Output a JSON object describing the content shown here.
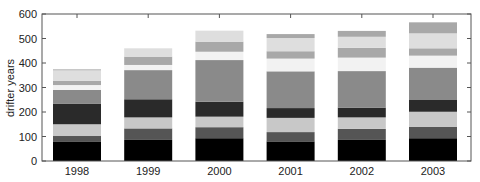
{
  "chart_data": {
    "type": "bar",
    "stacked": true,
    "title": "",
    "xlabel": "",
    "ylabel": "drifter years",
    "ylim": [
      0,
      600
    ],
    "yticks": [
      0,
      100,
      200,
      300,
      400,
      500,
      600
    ],
    "categories": [
      "1998",
      "1999",
      "2000",
      "2001",
      "2002",
      "2003"
    ],
    "grid": false,
    "legend": null,
    "series": [
      {
        "name": "segment-1",
        "color": "#000000",
        "values": [
          80,
          86,
          93,
          80,
          86,
          93
        ]
      },
      {
        "name": "segment-2",
        "color": "#555555",
        "values": [
          22,
          47,
          45,
          38,
          45,
          47
        ]
      },
      {
        "name": "segment-3",
        "color": "#c8c8c8",
        "values": [
          48,
          45,
          43,
          58,
          47,
          61
        ]
      },
      {
        "name": "segment-4",
        "color": "#2a2a2a",
        "values": [
          83,
          74,
          61,
          40,
          40,
          48
        ]
      },
      {
        "name": "segment-5",
        "color": "#8a8a8a",
        "values": [
          57,
          119,
          170,
          150,
          149,
          132
        ]
      },
      {
        "name": "segment-6",
        "color": "#f2f2f2",
        "values": [
          20,
          21,
          34,
          52,
          55,
          49
        ]
      },
      {
        "name": "segment-7",
        "color": "#a8a8a8",
        "values": [
          18,
          34,
          41,
          30,
          40,
          30
        ]
      },
      {
        "name": "segment-8",
        "color": "#dedede",
        "values": [
          42,
          34,
          45,
          54,
          45,
          61
        ]
      },
      {
        "name": "segment-9",
        "color": "#a8a8a8",
        "values": [
          4,
          0,
          0,
          16,
          24,
          45
        ]
      }
    ],
    "totals": [
      374,
      460,
      532,
      518,
      531,
      566
    ]
  }
}
